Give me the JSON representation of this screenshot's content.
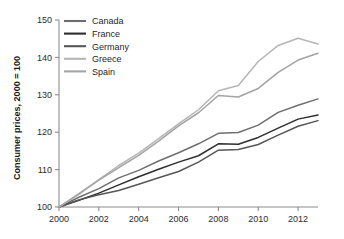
{
  "chart_data": {
    "type": "line",
    "title": "",
    "xlabel": "",
    "ylabel": "Consumer prices, 2000 = 100",
    "xlim": [
      2000,
      2013
    ],
    "ylim": [
      100,
      150
    ],
    "grid": false,
    "legend_position": "top-left",
    "x": [
      2000,
      2001,
      2002,
      2003,
      2004,
      2005,
      2006,
      2007,
      2008,
      2009,
      2010,
      2011,
      2012,
      2013
    ],
    "xticks": [
      "2000",
      "2002",
      "2004",
      "2006",
      "2008",
      "2010",
      "2012"
    ],
    "xtick_values": [
      2000,
      2002,
      2004,
      2006,
      2008,
      2010,
      2012
    ],
    "yticks": [
      "100",
      "110",
      "120",
      "130",
      "140",
      "150"
    ],
    "ytick_values": [
      100,
      110,
      120,
      130,
      140,
      150
    ],
    "series": [
      {
        "name": "Canada",
        "color": "#6e6e6e",
        "values": [
          100,
          102.6,
          104.9,
          107.8,
          109.8,
          112.3,
          114.5,
          116.9,
          119.7,
          119.9,
          121.9,
          125.3,
          127.2,
          128.9
        ]
      },
      {
        "name": "France",
        "color": "#2e2e2e",
        "values": [
          100,
          101.8,
          103.7,
          105.9,
          108.1,
          110.1,
          112.0,
          113.7,
          116.9,
          116.8,
          118.6,
          121.1,
          123.5,
          124.6
        ]
      },
      {
        "name": "Germany",
        "color": "#565656",
        "values": [
          100,
          101.9,
          103.3,
          104.4,
          106.1,
          107.8,
          109.5,
          112.0,
          115.2,
          115.4,
          116.7,
          119.2,
          121.6,
          123.1
        ]
      },
      {
        "name": "Greece",
        "color": "#b5b5b5",
        "values": [
          100,
          103.4,
          107.3,
          111.1,
          114.4,
          118.3,
          122.2,
          126.0,
          131.1,
          132.5,
          138.9,
          143.2,
          145.1,
          143.6
        ]
      },
      {
        "name": "Spain",
        "color": "#a3a3a3",
        "values": [
          100,
          103.6,
          107.2,
          110.5,
          113.8,
          117.6,
          121.7,
          125.2,
          129.8,
          129.4,
          131.7,
          136.0,
          139.3,
          141.1
        ]
      }
    ]
  },
  "legend": {
    "entries": [
      {
        "label": "Canada"
      },
      {
        "label": "France"
      },
      {
        "label": "Germany"
      },
      {
        "label": "Greece"
      },
      {
        "label": "Spain"
      }
    ]
  },
  "axes": {
    "y_title": "Consumer prices, 2000 = 100"
  }
}
